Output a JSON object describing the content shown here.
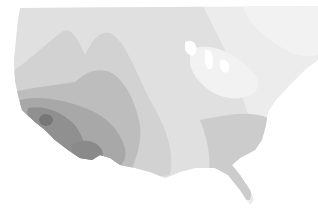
{
  "map": {
    "region": "Contiguous United States and southern Canada",
    "style": "grayscale filled contour map",
    "background": "#ffffff",
    "levels": [
      {
        "name": "level-1",
        "color": "#f0f0f0"
      },
      {
        "name": "level-2",
        "color": "#e3e3e3"
      },
      {
        "name": "level-3",
        "color": "#d6d6d6"
      },
      {
        "name": "level-4",
        "color": "#c6c6c6"
      },
      {
        "name": "level-5",
        "color": "#b2b2b2"
      },
      {
        "name": "level-6",
        "color": "#9a9a9a"
      },
      {
        "name": "level-7",
        "color": "#808080"
      }
    ]
  }
}
